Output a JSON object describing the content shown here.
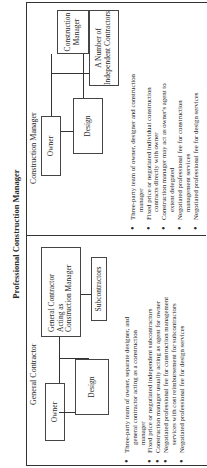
{
  "figure": {
    "title": "Professional Construction Manager",
    "orientation": "rotated 90 degrees counter-clockwise"
  },
  "panels": {
    "general_contractor": {
      "title": "General Contractor",
      "boxes": {
        "owner": "Owner",
        "design": "Design",
        "gc_as_cm": [
          "General Contractor",
          "Acting as",
          "Construction Manager"
        ],
        "subcontractors": "Subcontractors"
      },
      "bullets": [
        [
          "Three-party team of owner, separate designer, and",
          "general contractor acting as a construction",
          "manager"
        ],
        [
          "Fixed price or negotiated independent subcontractors"
        ],
        [
          "Construction manager usually acting as agent for owner"
        ],
        [
          "Negotiated professional fee for construction management",
          "services with cost reimbursement for subcontractors"
        ],
        [
          "Negotiated professional fee for design services"
        ]
      ]
    },
    "construction_manager": {
      "title": "Construction Manager",
      "boxes": {
        "owner": "Owner",
        "design": "Design",
        "construction_manager": [
          "Construction",
          "Manager"
        ],
        "independent_contractors": [
          "A Number of",
          "Independent Contractors"
        ]
      },
      "bullets": [
        [
          "Three-party team of owner, designer and construction",
          "manager"
        ],
        [
          "Fixed price or negotiated individual construction",
          "contracts directly with owner"
        ],
        [
          "Construction manager may act as owner's agent to",
          "extent delegated"
        ],
        [
          "Negotiated professional fee for construction",
          "management services"
        ],
        [
          "Negotiated professional fee for design services"
        ]
      ]
    }
  }
}
